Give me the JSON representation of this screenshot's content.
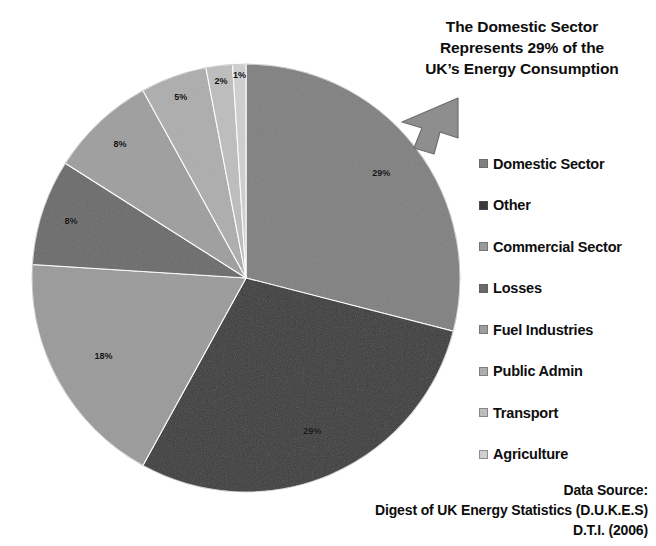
{
  "title": {
    "line1": "The Domestic Sector",
    "line2": "Represents 29% of the",
    "line3": "UK’s Energy Consumption"
  },
  "callout": {
    "icon": "arrow-down-left-icon",
    "points_to": "29%"
  },
  "legend": {
    "items": [
      {
        "label": "Domestic Sector",
        "color": "#808080"
      },
      {
        "label": "Other",
        "color": "#3a3a3a"
      },
      {
        "label": "Commercial Sector",
        "color": "#9a9a9a"
      },
      {
        "label": "Losses",
        "color": "#6a6a6a"
      },
      {
        "label": "Fuel Industries",
        "color": "#9e9e9e"
      },
      {
        "label": "Public Admin",
        "color": "#adadad"
      },
      {
        "label": "Transport",
        "color": "#bdbdbd"
      },
      {
        "label": "Agriculture",
        "color": "#cfcfcf"
      }
    ]
  },
  "source": {
    "line1": "Data Source:",
    "line2": "Digest of UK Energy Statistics (D.U.K.E.S)",
    "line3": "D.T.I. (2006)"
  },
  "chart_data": {
    "type": "pie",
    "title": "The Domestic Sector Represents 29% of the UK’s Energy Consumption",
    "xlabel": "",
    "ylabel": "",
    "start_angle_deg": 0,
    "direction": "clockwise",
    "value_unit": "percent",
    "legend_position": "right",
    "grid": false,
    "labels": [
      "Domestic Sector",
      "Other",
      "Commercial Sector",
      "Losses",
      "Fuel Industries",
      "Public Admin",
      "Transport",
      "Agriculture"
    ],
    "values": [
      29,
      29,
      18,
      8,
      8,
      5,
      2,
      1
    ],
    "data_labels": [
      "29%",
      "29%",
      "18%",
      "8%",
      "8%",
      "5%",
      "2%",
      "1%"
    ],
    "colors": [
      "#808080",
      "#3a3a3a",
      "#9a9a9a",
      "#6a6a6a",
      "#9e9e9e",
      "#adadad",
      "#bdbdbd",
      "#cfcfcf"
    ],
    "annotations": [
      {
        "text": "The Domestic Sector Represents 29% of the UK’s Energy Consumption",
        "target_slice": "Domestic Sector",
        "marker": "arrow"
      }
    ],
    "source": "Digest of UK Energy Statistics (D.U.K.E.S) D.T.I. (2006)"
  }
}
